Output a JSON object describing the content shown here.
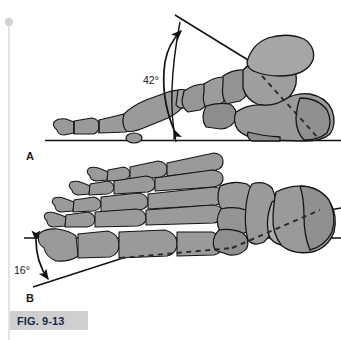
{
  "figure": {
    "caption_id": "FIG. 9-13",
    "panels": [
      {
        "letter": "A",
        "view": "lateral-sagittal-foot",
        "angle_label": "42°",
        "angle_value": 42,
        "description": "Lateral view of foot skeleton resting on ground line with talar declination angle"
      },
      {
        "letter": "B",
        "view": "dorsal-superior-foot",
        "angle_label": "16°",
        "angle_value": 16,
        "description": "Dorsal view of foot skeleton with horizontal reference line and talar axis angle"
      }
    ]
  },
  "colors": {
    "bone_fill": "#9a9a9a",
    "bone_shade": "#828282",
    "bone_light": "#b0b0b0",
    "outline": "#141414",
    "caption_bg": "#cfcfcf",
    "caption_text": "#1b2a4a",
    "binding_line": "#dcdcdc",
    "page_bg": "#ffffff"
  }
}
